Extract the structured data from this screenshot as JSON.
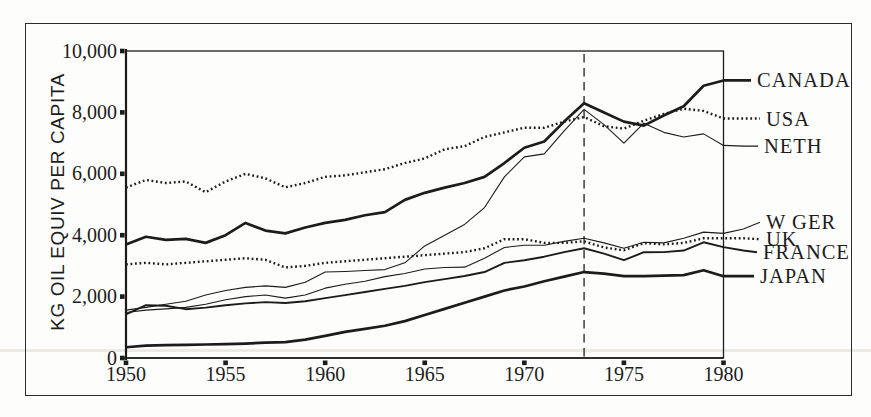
{
  "colors": {
    "ink": "#1c1c1c",
    "frame": "#2b2b2b",
    "paper": "#fdfdfb",
    "scan_artifact": "#ebebe3"
  },
  "chart_data": {
    "type": "line",
    "title": "",
    "xlabel": "",
    "ylabel": "KG OIL EQUIV PER CAPITA",
    "xlim": [
      1950,
      1981
    ],
    "ylim": [
      0,
      10000
    ],
    "grid": false,
    "legend_position": "right-margin-labels",
    "x_ticks": [
      1950,
      1955,
      1960,
      1965,
      1970,
      1975,
      1980
    ],
    "x_tick_labels": [
      "1950",
      "1955",
      "1960",
      "1965",
      "1970",
      "1975",
      "1980"
    ],
    "y_ticks": [
      0,
      2000,
      4000,
      6000,
      8000,
      10000
    ],
    "y_tick_labels": [
      "0",
      "2,000",
      "4,000",
      "6,000",
      "8,000",
      "10,000"
    ],
    "annotation_line": {
      "x": 1973,
      "style": "dashed-vertical"
    },
    "years": [
      1950,
      1951,
      1952,
      1953,
      1954,
      1955,
      1956,
      1957,
      1958,
      1959,
      1960,
      1961,
      1962,
      1963,
      1964,
      1965,
      1966,
      1967,
      1968,
      1969,
      1970,
      1971,
      1972,
      1973,
      1974,
      1975,
      1976,
      1977,
      1978,
      1979,
      1980,
      1981
    ],
    "series": [
      {
        "name": "CANADA",
        "style": "bold",
        "label_x": 757,
        "label_value": 9040,
        "values": [
          3700,
          3950,
          3850,
          3880,
          3750,
          4000,
          4400,
          4150,
          4060,
          4250,
          4400,
          4500,
          4650,
          4750,
          5150,
          5380,
          5550,
          5700,
          5900,
          6350,
          6850,
          7050,
          7700,
          8300,
          8000,
          7700,
          7570,
          7900,
          8200,
          8870,
          9040,
          9040
        ]
      },
      {
        "name": "USA",
        "style": "dotted",
        "label_x": 766,
        "label_value": 7800,
        "values": [
          5550,
          5800,
          5700,
          5750,
          5400,
          5750,
          6000,
          5850,
          5560,
          5700,
          5900,
          5950,
          6050,
          6150,
          6350,
          6500,
          6800,
          6900,
          7200,
          7350,
          7500,
          7500,
          7700,
          7850,
          7550,
          7470,
          7730,
          7950,
          8120,
          8050,
          7800,
          7800
        ]
      },
      {
        "name": "NETH",
        "style": "thin",
        "label_x": 764,
        "label_value": 6900,
        "values": [
          1560,
          1650,
          1750,
          1850,
          2050,
          2200,
          2300,
          2350,
          2300,
          2470,
          2800,
          2820,
          2850,
          2880,
          3100,
          3650,
          4000,
          4350,
          4900,
          5900,
          6550,
          6650,
          7400,
          8100,
          7600,
          7000,
          7650,
          7350,
          7200,
          7300,
          6925,
          6900
        ]
      },
      {
        "name": "W GER",
        "style": "thin",
        "label_x": 766,
        "label_value": 4420,
        "values": [
          1480,
          1560,
          1600,
          1650,
          1750,
          1900,
          2000,
          2050,
          1950,
          2050,
          2275,
          2400,
          2500,
          2650,
          2750,
          2900,
          2950,
          2960,
          3250,
          3600,
          3675,
          3675,
          3800,
          3900,
          3750,
          3575,
          3770,
          3750,
          3900,
          4100,
          4060,
          4200
        ]
      },
      {
        "name": "UK",
        "style": "dotted",
        "label_x": 766,
        "label_value": 3870,
        "values": [
          3050,
          3100,
          3050,
          3100,
          3150,
          3200,
          3250,
          3200,
          2950,
          3000,
          3100,
          3150,
          3200,
          3250,
          3300,
          3350,
          3400,
          3450,
          3575,
          3870,
          3870,
          3750,
          3750,
          3800,
          3600,
          3510,
          3740,
          3700,
          3750,
          3900,
          3900,
          3900
        ]
      },
      {
        "name": "FRANCE",
        "style": "medium",
        "label_x": 763,
        "label_value": 3445,
        "values": [
          1420,
          1720,
          1700,
          1590,
          1640,
          1720,
          1780,
          1820,
          1790,
          1850,
          1950,
          2050,
          2150,
          2250,
          2350,
          2470,
          2570,
          2670,
          2800,
          3100,
          3185,
          3300,
          3450,
          3575,
          3400,
          3185,
          3445,
          3450,
          3500,
          3770,
          3610,
          3500
        ]
      },
      {
        "name": "JAPAN",
        "style": "bold",
        "label_x": 760,
        "label_value": 2665,
        "values": [
          350,
          400,
          420,
          430,
          440,
          450,
          470,
          500,
          520,
          600,
          720,
          850,
          950,
          1050,
          1200,
          1400,
          1600,
          1800,
          2000,
          2200,
          2330,
          2500,
          2650,
          2800,
          2750,
          2665,
          2665,
          2680,
          2700,
          2860,
          2665,
          2665
        ]
      }
    ]
  }
}
